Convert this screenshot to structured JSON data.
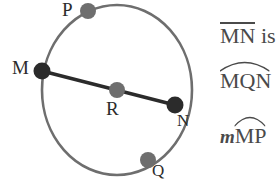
{
  "figure": {
    "type": "circle-geometry-diagram",
    "circle": {
      "center_label": "R",
      "cx": 117,
      "cy": 90,
      "r": 75,
      "stroke": "#6e6e6e"
    },
    "chord": {
      "from": "M",
      "to": "N",
      "stroke": "#2b2b2b"
    },
    "points": [
      {
        "label": "P",
        "x": 88,
        "y": 11,
        "dot": "#6e6e6e",
        "label_x": 62,
        "label_y": 0
      },
      {
        "label": "M",
        "x": 42,
        "y": 71,
        "dot": "#2b2b2b",
        "label_x": 12,
        "label_y": 58
      },
      {
        "label": "R",
        "x": 117,
        "y": 90,
        "dot": "#6e6e6e",
        "label_x": 106,
        "label_y": 99
      },
      {
        "label": "N",
        "x": 175,
        "y": 105,
        "dot": "#2b2b2b",
        "label_x": 177,
        "label_y": 112
      },
      {
        "label": "Q",
        "x": 148,
        "y": 160,
        "dot": "#6e6e6e",
        "label_x": 152,
        "label_y": 162
      }
    ]
  },
  "annotations": {
    "line1": {
      "name": "segment-MN",
      "overline_text": "MN",
      "trailing_text": " is",
      "notation": "overline"
    },
    "line2": {
      "name": "arc-MQN",
      "arc_text": "MQN",
      "notation": "arc"
    },
    "line3": {
      "name": "measure-arc-MP",
      "prefix": "m",
      "arc_text": "MP",
      "notation": "arc"
    }
  },
  "colors": {
    "dot_dark": "#2b2b2b",
    "dot_gray": "#6e6e6e",
    "circle_stroke": "#6e6e6e",
    "chord_stroke": "#2b2b2b",
    "text": "#4a4a4a",
    "background": "#ffffff"
  }
}
